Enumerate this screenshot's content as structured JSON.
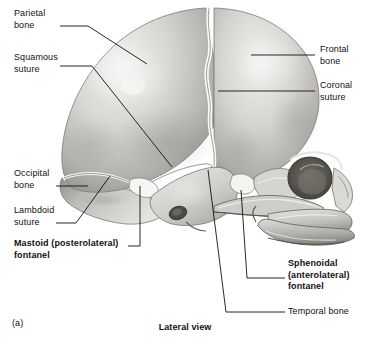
{
  "figure": {
    "part_letter": "(a)",
    "caption": "Lateral view",
    "palette": {
      "background": "#ffffff",
      "ink": "#111111",
      "bone_light": "#ededea",
      "bone_mid": "#c9c8c4",
      "bone_shadow": "#9a9996",
      "bone_dark": "#6e6d6a",
      "suture_highlight": "#fbfbf9",
      "orbit_dark": "#55534f"
    }
  },
  "labels": [
    {
      "id": "parietal-bone",
      "text": "Parietal\nbone",
      "bold": false,
      "x": 14,
      "y": 8,
      "align": "left"
    },
    {
      "id": "squamous-suture",
      "text": "Squamous\nsuture",
      "bold": false,
      "x": 14,
      "y": 52,
      "align": "left"
    },
    {
      "id": "occipital-bone",
      "text": "Occipital\nbone",
      "bold": false,
      "x": 14,
      "y": 168,
      "align": "left"
    },
    {
      "id": "lambdoid-suture",
      "text": "Lambdoid\nsuture",
      "bold": false,
      "x": 14,
      "y": 205,
      "align": "left"
    },
    {
      "id": "mastoid-fontanel",
      "text": "Mastoid (posterolateral)\nfontanel",
      "bold": true,
      "x": 14,
      "y": 238,
      "align": "left"
    },
    {
      "id": "frontal-bone",
      "text": "Frontal\nbone",
      "bold": false,
      "x": 320,
      "y": 44,
      "align": "left"
    },
    {
      "id": "coronal-suture",
      "text": "Coronal\nsuture",
      "bold": false,
      "x": 320,
      "y": 80,
      "align": "left"
    },
    {
      "id": "sphenoidal-fontanel",
      "text": "Sphenoidal\n(anterolateral)\nfontanel",
      "bold": true,
      "x": 288,
      "y": 258,
      "align": "left"
    },
    {
      "id": "temporal-bone",
      "text": "Temporal bone",
      "bold": false,
      "x": 288,
      "y": 306,
      "align": "left"
    }
  ],
  "leaders": [
    {
      "id": "parietal-bone-leader",
      "points": "60,26 88,26 147,64"
    },
    {
      "id": "squamous-suture-leader",
      "points": "60,66 92,66 172,167"
    },
    {
      "id": "occipital-bone-leader",
      "points": "56,186 88,186"
    },
    {
      "id": "lambdoid-suture-leader",
      "points": "56,223 76,223 110,176"
    },
    {
      "id": "mastoid-fontanel-leader",
      "points": "140,186 140,246 128,246"
    },
    {
      "id": "frontal-bone-leader",
      "points": "315,55 251,55"
    },
    {
      "id": "coronal-suture-leader",
      "points": "315,91 218,91"
    },
    {
      "id": "sphenoidal-fontanel-leader",
      "points": "285,278 247,278 241,190"
    },
    {
      "id": "temporal-bone-leader",
      "points": "285,312 226,312 208,170"
    }
  ],
  "structures": [
    {
      "id": "parietal-bone",
      "name": "Parietal bone"
    },
    {
      "id": "frontal-bone",
      "name": "Frontal bone"
    },
    {
      "id": "occipital-bone",
      "name": "Occipital bone"
    },
    {
      "id": "temporal-bone",
      "name": "Temporal bone"
    },
    {
      "id": "coronal-suture",
      "name": "Coronal suture"
    },
    {
      "id": "squamous-suture",
      "name": "Squamous suture"
    },
    {
      "id": "lambdoid-suture",
      "name": "Lambdoid suture"
    },
    {
      "id": "mastoid-fontanel",
      "name": "Mastoid (posterolateral) fontanel"
    },
    {
      "id": "sphenoidal-fontanel",
      "name": "Sphenoidal (anterolateral) fontanel"
    },
    {
      "id": "orbit",
      "name": "Orbit"
    },
    {
      "id": "zygomatic-arch",
      "name": "Zygomatic arch"
    },
    {
      "id": "maxilla",
      "name": "Maxilla"
    },
    {
      "id": "mandible",
      "name": "Mandible"
    }
  ]
}
